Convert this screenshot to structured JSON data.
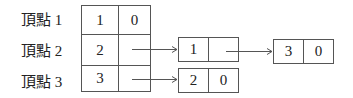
{
  "vertices": [
    {
      "label": "頂點 1",
      "id": "1",
      "link": "0"
    },
    {
      "label": "頂點 2",
      "id": "2",
      "link": ""
    },
    {
      "label": "頂點 3",
      "id": "3",
      "link": ""
    }
  ],
  "nodes": [
    {
      "value": "1",
      "link": ""
    },
    {
      "value": "3",
      "link": "0"
    },
    {
      "value": "2",
      "link": "0"
    }
  ]
}
